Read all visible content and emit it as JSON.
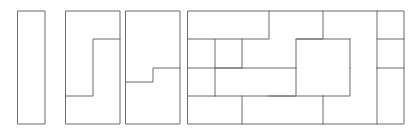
{
  "figure": {
    "background_color": "#ffffff",
    "stroke_color": "#6b6b6b",
    "stroke_width": 1,
    "canvas": {
      "width": 418,
      "height": 135
    }
  },
  "geometry": {
    "cell": 27,
    "row": 28.25,
    "origin_y": 11,
    "panels": [
      {
        "name": "panel-bar",
        "label": "1x4 bar",
        "x": 18,
        "y": 11,
        "cols": 1,
        "rows": 4,
        "width": 27,
        "height": 113,
        "piece_count": 1
      },
      {
        "name": "panel-c-shape",
        "label": "2x4 split into C-piece and bar",
        "x": 66,
        "y": 11,
        "cols": 2,
        "rows": 4,
        "width": 54,
        "height": 113,
        "piece_count": 2
      },
      {
        "name": "panel-s-shape",
        "label": "2x4 split into two S-pieces",
        "x": 126,
        "y": 11,
        "cols": 2,
        "rows": 4,
        "width": 54,
        "height": 113,
        "piece_count": 2
      },
      {
        "name": "panel-tiling",
        "label": "8x4 tiling",
        "x": 188,
        "y": 11,
        "cols": 8,
        "rows": 4,
        "width": 216,
        "height": 113,
        "piece_count": 8
      }
    ]
  },
  "outlines": {
    "panel_bar_rect": "M 18 11 L 45 11 L 45 124 L 18 124 Z",
    "panel_c_rect": "M 66 11 L 120 11 L 120 124 L 66 124 Z",
    "panel_s_rect": "M 126 11 L 180 11 L 180 124 L 126 124 Z",
    "panel_tiling_rect": "M 188 11 L 404 11 L 404 124 L 188 124 Z"
  },
  "dividers": {
    "panel_c_divider": "M 120 39 L 93 39 L 93 96 L 66 96",
    "panel_s_divider": "M 180 68 L 153 68 L 153 82 L 126 82",
    "panel_tiling_lines": [
      "M 188 39 L 215 39 L 215 68 L 242 68",
      "M 215 39 L 269 39 L 269 11",
      "M 242 68 L 242 39",
      "M 323 11 L 323 39 L 296 39 L 296 68",
      "M 296 39 L 350 39",
      "M 350 39 L 350 68",
      "M 377 11 L 377 68",
      "M 377 39 L 404 39",
      "M 188 68 L 296 68",
      "M 296 68 L 296 96 L 269 96",
      "M 215 96 L 323 96",
      "M 215 96 L 215 68",
      "M 242 96 L 242 124",
      "M 350 68 L 350 96 L 323 96",
      "M 323 96 L 323 124",
      "M 377 68 L 404 68",
      "M 377 68 L 377 124",
      "M 188 96 L 215 96"
    ]
  },
  "pieces": {
    "bar_tile": "1x4 rectangle",
    "c_tile": "C/L shaped hexomino",
    "s_tile": "S/Z stepped piece",
    "tiling_tile": "interlocking L-piece"
  }
}
